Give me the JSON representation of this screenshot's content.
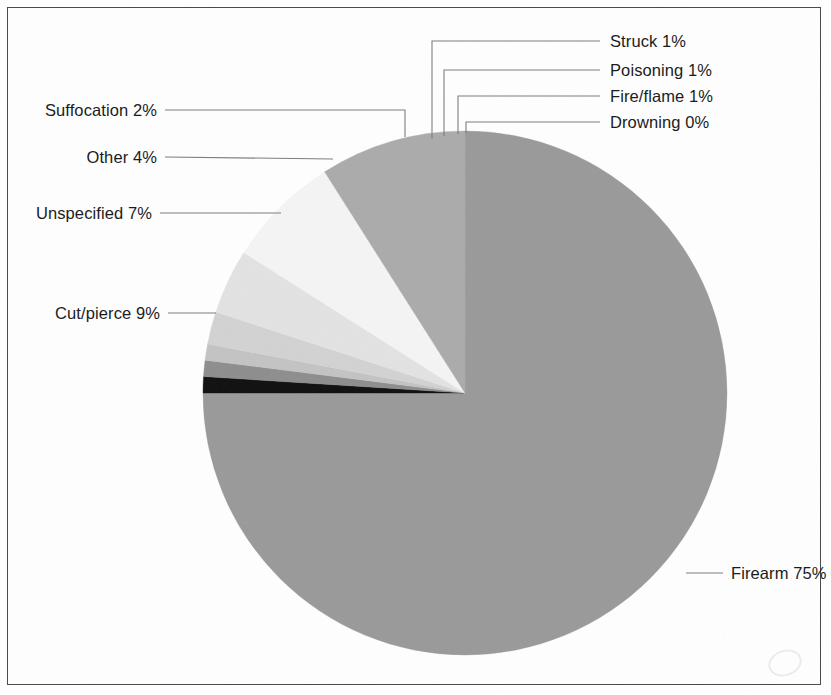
{
  "chart_data": {
    "type": "pie",
    "title": "",
    "subtitle": "",
    "xlabel": "",
    "ylabel": "",
    "legend_position": "callout-labels",
    "grid": false,
    "units": "percent",
    "start_angle_deg": 0,
    "direction": "clockwise",
    "categories": [
      "Firearm",
      "Drowning",
      "Fire/flame",
      "Poisoning",
      "Struck",
      "Suffocation",
      "Other",
      "Unspecified",
      "Cut/pierce"
    ],
    "values": [
      75,
      0,
      1,
      1,
      1,
      2,
      4,
      7,
      9
    ],
    "slices": [
      {
        "name": "firearm",
        "label": "Firearm 75%",
        "category": "Firearm",
        "value": 75,
        "value_text": "75%",
        "color": "#9a9a9a",
        "label_side": "right"
      },
      {
        "name": "drowning",
        "label": "Drowning 0%",
        "category": "Drowning",
        "value": 0,
        "value_text": "0%",
        "color": "#6d6d6d",
        "label_side": "right"
      },
      {
        "name": "fire-flame",
        "label": "Fire/flame 1%",
        "category": "Fire/flame",
        "value": 1,
        "value_text": "1%",
        "color": "#111111",
        "label_side": "right"
      },
      {
        "name": "poisoning",
        "label": "Poisoning 1%",
        "category": "Poisoning",
        "value": 1,
        "value_text": "1%",
        "color": "#8e8e8e",
        "label_side": "right"
      },
      {
        "name": "struck",
        "label": "Struck 1%",
        "category": "Struck",
        "value": 1,
        "value_text": "1%",
        "color": "#c3c3c3",
        "label_side": "right"
      },
      {
        "name": "suffocation",
        "label": "Suffocation 2%",
        "category": "Suffocation",
        "value": 2,
        "value_text": "2%",
        "color": "#d2d2d2",
        "label_side": "left"
      },
      {
        "name": "other",
        "label": "Other 4%",
        "category": "Other",
        "value": 4,
        "value_text": "4%",
        "color": "#e2e2e2",
        "label_side": "left"
      },
      {
        "name": "unspecified",
        "label": "Unspecified 7%",
        "category": "Unspecified",
        "value": 7,
        "value_text": "7%",
        "color": "#f4f4f4",
        "label_side": "left"
      },
      {
        "name": "cut-pierce",
        "label": "Cut/pierce 9%",
        "category": "Cut/pierce",
        "value": 9,
        "value_text": "9%",
        "color": "#ababab",
        "label_side": "left"
      }
    ]
  },
  "figure": {
    "background_color": "#ffffff",
    "border_color": "#4a4a4a",
    "text_color": "#1a1a1a",
    "leader_line_color": "#7d7d7d"
  },
  "labels": {
    "struck": "Struck 1%",
    "poisoning": "Poisoning 1%",
    "fire_flame": "Fire/flame 1%",
    "drowning": "Drowning 0%",
    "suffocation": "Suffocation 2%",
    "other": "Other 4%",
    "unspecified": "Unspecified 7%",
    "cut_pierce": "Cut/pierce 9%",
    "firearm": "Firearm 75%"
  }
}
